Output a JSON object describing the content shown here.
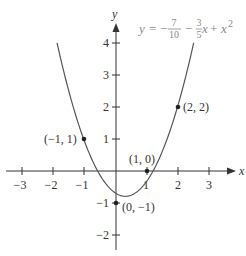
{
  "chart_data": {
    "type": "line",
    "title": "",
    "equation": {
      "lhs": "y",
      "eq": "=",
      "minus1": "−",
      "frac1_num": "7",
      "frac1_den": "10",
      "minus2": "−",
      "frac2_num": "3",
      "frac2_den": "5",
      "x_term": "x",
      "plus": "+",
      "x2_base": "x",
      "x2_exp": "2"
    },
    "function": "y = -7/10 - 3/5 x + x^2",
    "xlabel": "x",
    "ylabel": "y",
    "xlim": [
      -3.5,
      3.5
    ],
    "ylim": [
      -2.3,
      4.5
    ],
    "grid": false,
    "x_ticks": [
      -3,
      -2,
      -1,
      1,
      2,
      3
    ],
    "x_tick_labels": [
      "−3",
      "−2",
      "−1",
      "1",
      "2",
      "3"
    ],
    "y_ticks": [
      -2,
      -1,
      1,
      2,
      3,
      4
    ],
    "y_tick_labels": [
      "−2",
      "−1",
      "1",
      "2",
      "3",
      "4"
    ],
    "curve_x_range": [
      -1.89,
      2.49
    ],
    "points": [
      {
        "x": -1,
        "y": 1,
        "label": "(−1, 1)"
      },
      {
        "x": 0,
        "y": -1,
        "label": "(0, −1)"
      },
      {
        "x": 1,
        "y": 0,
        "label": "(1, 0)"
      },
      {
        "x": 2,
        "y": 2,
        "label": "(2, 2)"
      }
    ],
    "colors": {
      "axis": "#333333",
      "curve": "#555555",
      "equation": "#8a8a8a"
    }
  }
}
